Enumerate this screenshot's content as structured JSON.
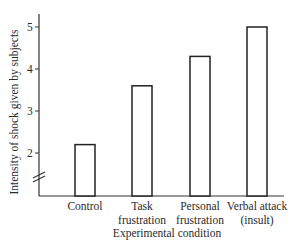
{
  "chart_data": {
    "type": "bar",
    "title": "",
    "xlabel": "Experimental condition",
    "ylabel": "Intensity of shock given by subjects",
    "categories": [
      "Control",
      "Task frustration",
      "Personal frustration",
      "Verbal attack (insult)"
    ],
    "category_lines": [
      [
        "Control",
        ""
      ],
      [
        "Task",
        "frustration"
      ],
      [
        "Personal",
        "frustration"
      ],
      [
        "Verbal attack",
        "(insult)"
      ]
    ],
    "values": [
      2.2,
      3.6,
      4.3,
      5.0
    ],
    "yticks": [
      2,
      3,
      4,
      5
    ],
    "ylim": [
      1,
      5.4
    ],
    "axis_break": true,
    "grid": false,
    "legend": null,
    "bar_style": "hollow outline"
  }
}
